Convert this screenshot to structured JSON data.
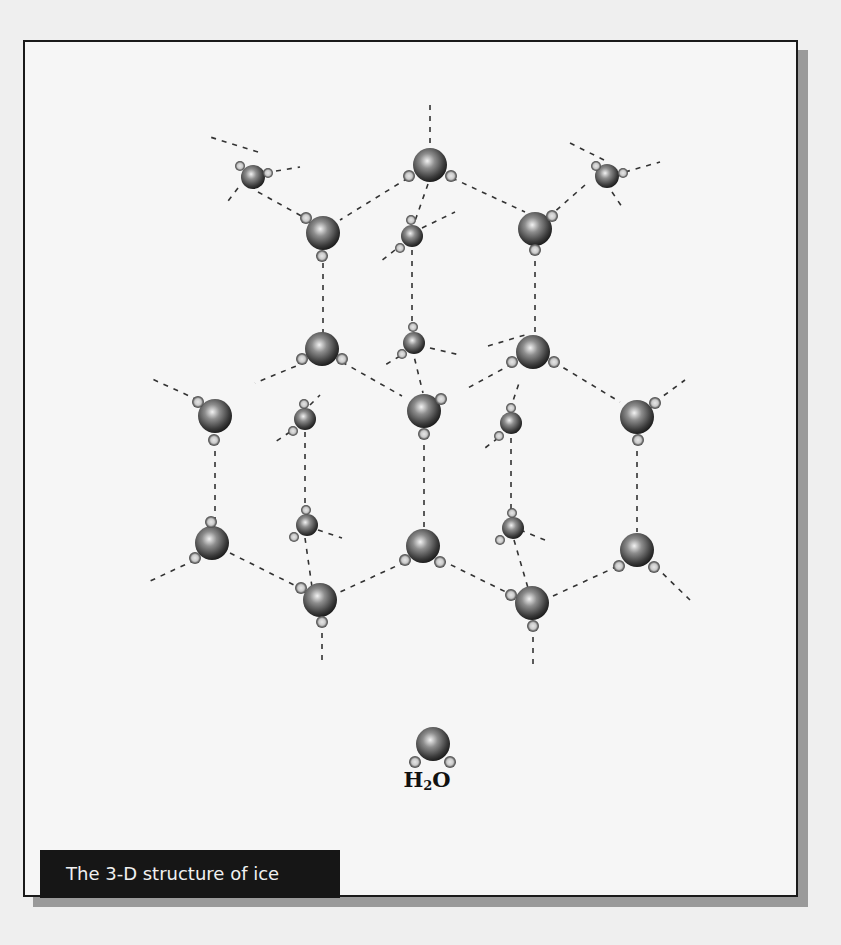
{
  "figure": {
    "caption": "The 3-D structure of ice",
    "molecule_label": {
      "prefix": "H",
      "subscript": "2",
      "suffix": "O"
    },
    "colors": {
      "frame_border": "#1a1a1a",
      "shadow": "#9a9a9a",
      "caption_bg": "#161616",
      "caption_text": "#f0f0f0",
      "oxygen": "#555555",
      "bond": "#333333"
    }
  },
  "molecules": [
    {
      "x": 430,
      "y": 165,
      "r": 17,
      "h": [
        [
          409,
          176
        ],
        [
          451,
          176
        ]
      ]
    },
    {
      "x": 253,
      "y": 177,
      "r": 12,
      "h": [
        [
          240,
          166
        ],
        [
          268,
          173
        ]
      ]
    },
    {
      "x": 607,
      "y": 176,
      "r": 12,
      "h": [
        [
          596,
          166
        ],
        [
          623,
          173
        ]
      ]
    },
    {
      "x": 323,
      "y": 233,
      "r": 17,
      "h": [
        [
          306,
          218
        ],
        [
          322,
          256
        ]
      ]
    },
    {
      "x": 412,
      "y": 236,
      "r": 11,
      "h": [
        [
          411,
          220
        ],
        [
          400,
          248
        ]
      ]
    },
    {
      "x": 535,
      "y": 229,
      "r": 17,
      "h": [
        [
          552,
          216
        ],
        [
          535,
          250
        ]
      ]
    },
    {
      "x": 322,
      "y": 349,
      "r": 17,
      "h": [
        [
          302,
          359
        ],
        [
          342,
          359
        ]
      ]
    },
    {
      "x": 414,
      "y": 343,
      "r": 11,
      "h": [
        [
          413,
          327
        ],
        [
          402,
          354
        ]
      ]
    },
    {
      "x": 533,
      "y": 352,
      "r": 17,
      "h": [
        [
          512,
          362
        ],
        [
          554,
          362
        ]
      ]
    },
    {
      "x": 215,
      "y": 416,
      "r": 17,
      "h": [
        [
          198,
          402
        ],
        [
          214,
          440
        ]
      ]
    },
    {
      "x": 305,
      "y": 419,
      "r": 11,
      "h": [
        [
          304,
          404
        ],
        [
          293,
          431
        ]
      ]
    },
    {
      "x": 424,
      "y": 411,
      "r": 17,
      "h": [
        [
          441,
          399
        ],
        [
          424,
          434
        ]
      ]
    },
    {
      "x": 511,
      "y": 423,
      "r": 11,
      "h": [
        [
          511,
          408
        ],
        [
          499,
          436
        ]
      ]
    },
    {
      "x": 637,
      "y": 417,
      "r": 17,
      "h": [
        [
          655,
          403
        ],
        [
          638,
          440
        ]
      ]
    },
    {
      "x": 212,
      "y": 543,
      "r": 17,
      "h": [
        [
          211,
          522
        ],
        [
          195,
          558
        ]
      ]
    },
    {
      "x": 307,
      "y": 525,
      "r": 11,
      "h": [
        [
          306,
          510
        ],
        [
          294,
          537
        ]
      ]
    },
    {
      "x": 423,
      "y": 546,
      "r": 17,
      "h": [
        [
          405,
          560
        ],
        [
          440,
          562
        ]
      ]
    },
    {
      "x": 513,
      "y": 528,
      "r": 11,
      "h": [
        [
          512,
          513
        ],
        [
          500,
          540
        ]
      ]
    },
    {
      "x": 637,
      "y": 550,
      "r": 17,
      "h": [
        [
          619,
          566
        ],
        [
          654,
          567
        ]
      ]
    },
    {
      "x": 320,
      "y": 600,
      "r": 17,
      "h": [
        [
          301,
          588
        ],
        [
          322,
          622
        ]
      ]
    },
    {
      "x": 532,
      "y": 603,
      "r": 17,
      "h": [
        [
          511,
          595
        ],
        [
          533,
          626
        ]
      ]
    },
    {
      "x": 433,
      "y": 744,
      "r": 17,
      "h": [
        [
          415,
          762
        ],
        [
          450,
          762
        ]
      ]
    }
  ],
  "bonds": [
    [
      430,
      105,
      430,
      147
    ],
    [
      258,
      152,
      210,
      137
    ],
    [
      276,
      171,
      300,
      167
    ],
    [
      238,
      188,
      225,
      205
    ],
    [
      258,
      192,
      305,
      218
    ],
    [
      604,
      160,
      570,
      143
    ],
    [
      625,
      172,
      660,
      162
    ],
    [
      612,
      192,
      622,
      207
    ],
    [
      408,
      178,
      340,
      220
    ],
    [
      452,
      178,
      525,
      212
    ],
    [
      428,
      184,
      415,
      221
    ],
    [
      422,
      228,
      455,
      212
    ],
    [
      395,
      250,
      380,
      262
    ],
    [
      585,
      185,
      552,
      214
    ],
    [
      323,
      252,
      323,
      333
    ],
    [
      412,
      250,
      412,
      328
    ],
    [
      535,
      250,
      535,
      335
    ],
    [
      306,
      362,
      255,
      383
    ],
    [
      342,
      362,
      402,
      396
    ],
    [
      512,
      364,
      466,
      389
    ],
    [
      554,
      362,
      620,
      402
    ],
    [
      430,
      348,
      460,
      355
    ],
    [
      400,
      356,
      385,
      365
    ],
    [
      198,
      400,
      150,
      378
    ],
    [
      655,
      402,
      685,
      380
    ],
    [
      412,
      348,
      423,
      393
    ],
    [
      488,
      346,
      525,
      335
    ],
    [
      310,
      405,
      320,
      395
    ],
    [
      290,
      432,
      275,
      442
    ],
    [
      510,
      410,
      520,
      380
    ],
    [
      498,
      438,
      485,
      448
    ],
    [
      215,
      440,
      215,
      523
    ],
    [
      424,
      434,
      424,
      528
    ],
    [
      305,
      432,
      305,
      510
    ],
    [
      511,
      438,
      511,
      513
    ],
    [
      637,
      440,
      637,
      532
    ],
    [
      195,
      560,
      148,
      582
    ],
    [
      230,
      553,
      300,
      588
    ],
    [
      441,
      560,
      510,
      594
    ],
    [
      405,
      562,
      340,
      592
    ],
    [
      318,
      530,
      342,
      538
    ],
    [
      520,
      530,
      545,
      540
    ],
    [
      305,
      538,
      312,
      587
    ],
    [
      514,
      540,
      528,
      588
    ],
    [
      655,
      566,
      690,
      600
    ],
    [
      553,
      596,
      618,
      566
    ],
    [
      322,
      622,
      322,
      665
    ],
    [
      533,
      626,
      533,
      668
    ]
  ]
}
